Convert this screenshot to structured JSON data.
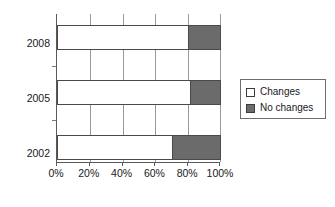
{
  "chart_data": {
    "type": "bar",
    "orientation": "horizontal",
    "stacked": true,
    "stack_total": 100,
    "title": "",
    "subtitle": "",
    "xlabel": "",
    "ylabel": "",
    "categories": [
      "2008",
      "2005",
      "2002"
    ],
    "series": [
      {
        "name": "Changes",
        "values": [
          80,
          81,
          70
        ],
        "color": "#ffffff"
      },
      {
        "name": "No changes",
        "values": [
          20,
          19,
          30
        ],
        "color": "#6b6b6b"
      }
    ],
    "xlim": [
      0,
      100
    ],
    "xticks": [
      0,
      20,
      40,
      60,
      80,
      100
    ],
    "xticklabels": [
      "0%",
      "20%",
      "40%",
      "60%",
      "80%",
      "100%"
    ],
    "yticklabels": [
      "2008",
      "2005",
      "2002"
    ],
    "grid": "vertical",
    "legend_position": "right",
    "legend_entries": [
      "Changes",
      "No changes"
    ]
  },
  "legend": {
    "items": [
      {
        "label": "Changes",
        "swatch": "white"
      },
      {
        "label": "No changes",
        "swatch": "gray"
      }
    ]
  },
  "axes": {
    "x_tick_labels": [
      "0%",
      "20%",
      "40%",
      "60%",
      "80%",
      "100%"
    ],
    "y_tick_labels": [
      "2008",
      "2005",
      "2002"
    ]
  },
  "colors": {
    "changes": "#ffffff",
    "no_changes": "#6b6b6b",
    "axis": "#5a5a5a",
    "grid": "#9a9a9a",
    "bar_outline": "#4a4a4a",
    "text": "#1a1a1a"
  }
}
